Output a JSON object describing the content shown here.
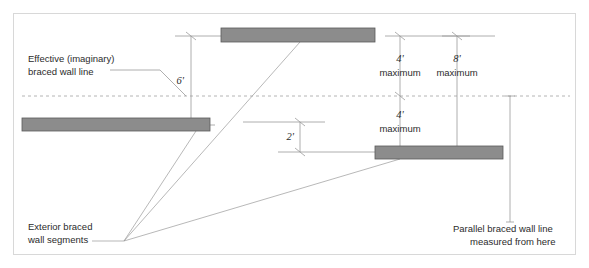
{
  "figure": {
    "background_color": "#ffffff",
    "border_color": "#d8d8d8",
    "wall_fill_color": "#8c8c8c",
    "wall_stroke_color": "#5a5a5a",
    "line_color": "#9a9a9a",
    "dashed_line_color": "#b4b4b4",
    "text_color": "#2b2b2b"
  },
  "annotations": {
    "effective_line_note_1": "Effective (imaginary)",
    "effective_line_note_2": "braced wall line",
    "exterior_note_1": "Exterior braced",
    "exterior_note_2": "wall segments",
    "parallel_note_1": "Parallel braced wall line",
    "parallel_note_2": "measured from here"
  },
  "dimensions": {
    "offset_top": {
      "value": "6'",
      "unit_note": ""
    },
    "offset_small": {
      "value": "2'",
      "unit_note": ""
    },
    "spacing_left": {
      "value": "4'",
      "unit_note": "maximum"
    },
    "spacing_right": {
      "value": "8'",
      "unit_note": "maximum"
    },
    "spacing_lower": {
      "value": "4'",
      "unit_note": "maximum"
    }
  },
  "wall_segments": [
    {
      "name": "top-wall-segment",
      "x": 221,
      "y": 28,
      "width": 154,
      "height": 14
    },
    {
      "name": "left-wall-segment",
      "x": 22,
      "y": 118,
      "width": 188,
      "height": 13
    },
    {
      "name": "lower-right-wall-segment",
      "x": 375,
      "y": 146,
      "width": 128,
      "height": 13
    }
  ],
  "reference_line": {
    "name": "effective-braced-wall-line",
    "y": 96,
    "x_start": 22,
    "x_end": 570,
    "style": "dashed"
  }
}
